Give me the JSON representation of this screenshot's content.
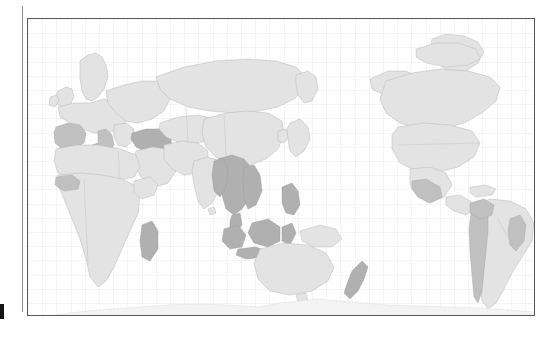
{
  "figure": {
    "kind": "world-choropleth-map",
    "projection_center": "pacific",
    "frame_color": "#5a5a5a",
    "background_color": "#ffffff",
    "graticule_visible": true,
    "title": "",
    "legend_visible": false,
    "axis_labels_visible": false
  },
  "page": {
    "margin_rule_visible": true,
    "cropped_text_top": [
      "...",
      "...",
      "..."
    ],
    "crop_marker_visible": true
  },
  "palette": {
    "land": "#e3e3e3",
    "land_border": "#b4b4b4",
    "highlight_light": "#c0c0c0",
    "highlight_dark": "#b0b0b0",
    "antarctica": "#f3f3f3",
    "ocean": "#ffffff",
    "graticule": "#8c8caa"
  },
  "chart_data": {
    "type": "heatmap",
    "title": "",
    "xlabel": "",
    "ylabel": "",
    "grid": true,
    "legend_position": "none",
    "categories": [
      "Portugal",
      "Spain",
      "Italy",
      "Greece",
      "Turkey",
      "Georgia",
      "Armenia",
      "Azerbaijan",
      "Myanmar",
      "Thailand",
      "Laos",
      "Vietnam",
      "Cambodia",
      "Malaysia",
      "Indonesia",
      "Philippines",
      "New Zealand",
      "Madagascar",
      "Colombia",
      "Ecuador",
      "Peru",
      "Bolivia",
      "Chile",
      "Brazil",
      "Mexico",
      "China",
      "India",
      "United States",
      "Canada",
      "Russia",
      "Australia",
      "Japan",
      "Antarctica"
    ],
    "values": [
      2,
      2,
      2,
      1,
      2,
      2,
      2,
      2,
      3,
      3,
      3,
      3,
      3,
      3,
      3,
      3,
      3,
      3,
      2,
      2,
      2,
      2,
      2,
      2,
      1,
      1,
      1,
      1,
      1,
      1,
      1,
      1,
      0
    ],
    "value_classes": {
      "0": "no-data",
      "1": "low",
      "2": "medium",
      "3": "high"
    },
    "class_colors": {
      "no-data": "#f3f3f3",
      "low": "#e3e3e3",
      "medium": "#c0c0c0",
      "high": "#b0b0b0"
    },
    "highlighted_regions": [
      "Iberian Peninsula",
      "Italy",
      "Anatolia & Caucasus",
      "Mainland Southeast Asia",
      "Maritime Southeast Asia",
      "Philippines",
      "New Zealand",
      "Madagascar",
      "Andean South America",
      "Eastern Brazil",
      "Mexican coasts",
      "West African coast"
    ]
  }
}
